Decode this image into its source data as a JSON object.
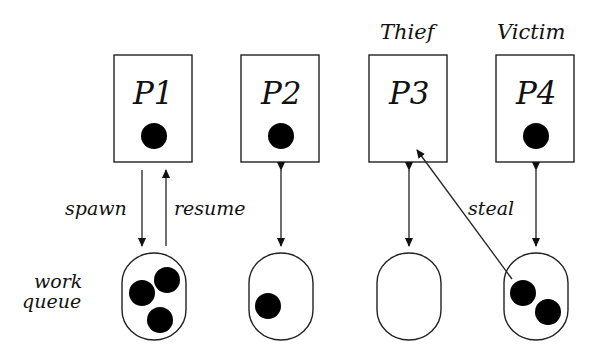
{
  "diagram": {
    "processors": [
      {
        "id": "P1",
        "label": "P1",
        "role": "",
        "has_task": true,
        "queue_tasks": 3
      },
      {
        "id": "P2",
        "label": "P2",
        "role": "",
        "has_task": true,
        "queue_tasks": 1
      },
      {
        "id": "P3",
        "label": "P3",
        "role": "Thief",
        "has_task": false,
        "queue_tasks": 0
      },
      {
        "id": "P4",
        "label": "P4",
        "role": "Victim",
        "has_task": true,
        "queue_tasks": 2
      }
    ],
    "edges": {
      "spawn": "spawn",
      "resume": "resume",
      "steal": "steal"
    },
    "queue_label_line1": "work",
    "queue_label_line2": "queue",
    "colors": {
      "stroke": "#222222",
      "fill": "#000000",
      "background": "#ffffff"
    }
  }
}
